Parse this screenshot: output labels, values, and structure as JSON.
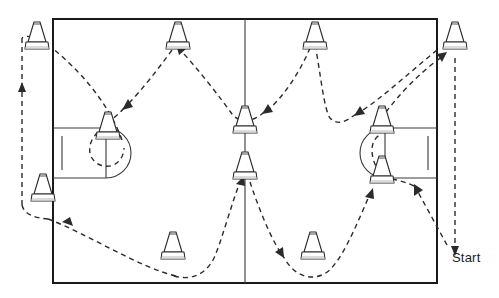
{
  "diagram": {
    "type": "court-drill-diagram",
    "colors": {
      "court_line": "#1a1a1a",
      "court_line_thin": "#3a3a3a",
      "path": "#2b2b2b",
      "cone_outline": "#2a2a2a",
      "cone_fill": "#ffffff",
      "background": "#ffffff",
      "label_text": "#1a1a1a"
    },
    "labels": [
      {
        "id": "start",
        "text": "Start",
        "x": 452,
        "y": 250
      }
    ],
    "court": {
      "boundary": {
        "x": 53,
        "y": 19,
        "width": 384,
        "height": 264
      },
      "center_line_x": 245,
      "left_key": {
        "x": 53,
        "y": 128,
        "width": 52,
        "height": 50
      },
      "right_key": {
        "x": 385,
        "y": 128,
        "width": 52,
        "height": 50
      },
      "left_circle": {
        "cx": 105,
        "cy": 153,
        "r": 25
      },
      "right_circle": {
        "cx": 385,
        "cy": 153,
        "r": 25
      }
    },
    "cones": [
      {
        "id": "cone-outside-top-left",
        "x": 37,
        "y": 38,
        "location": "outside-left-top"
      },
      {
        "id": "cone-top-left",
        "x": 178,
        "y": 38,
        "location": "top-baseline-left"
      },
      {
        "id": "cone-top-right",
        "x": 315,
        "y": 38,
        "location": "top-baseline-right"
      },
      {
        "id": "cone-outside-top-right",
        "x": 455,
        "y": 38,
        "location": "outside-right-top"
      },
      {
        "id": "cone-left-key",
        "x": 108,
        "y": 128,
        "location": "left-free-throw"
      },
      {
        "id": "cone-center-upper",
        "x": 245,
        "y": 122,
        "location": "center-upper"
      },
      {
        "id": "cone-right-key-upper",
        "x": 382,
        "y": 122,
        "location": "right-free-throw-upper"
      },
      {
        "id": "cone-center-lower",
        "x": 245,
        "y": 168,
        "location": "center-lower"
      },
      {
        "id": "cone-right-key-lower",
        "x": 382,
        "y": 172,
        "location": "right-free-throw-lower"
      },
      {
        "id": "cone-outside-left-mid",
        "x": 43,
        "y": 190,
        "location": "outside-left-middle"
      },
      {
        "id": "cone-bottom-left",
        "x": 173,
        "y": 248,
        "location": "bottom-baseline-left"
      },
      {
        "id": "cone-bottom-right",
        "x": 313,
        "y": 248,
        "location": "bottom-baseline-right"
      }
    ],
    "path": {
      "description": "Dashed zig-zag weave route starting outside the right sideline, weaving between cones across the court and returning along the left side.",
      "arrow_count": 11
    }
  }
}
